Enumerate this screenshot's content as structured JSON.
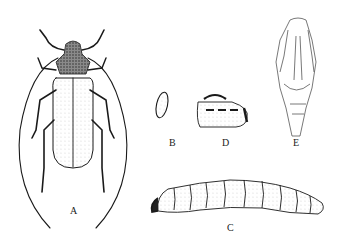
{
  "figure": {
    "panels": [
      {
        "id": "A",
        "label": "A",
        "subject": "adult beetle (dorsal view)"
      },
      {
        "id": "B",
        "label": "B",
        "subject": "egg"
      },
      {
        "id": "C",
        "label": "C",
        "subject": "larva"
      },
      {
        "id": "D",
        "label": "D",
        "subject": "oviposition scar"
      },
      {
        "id": "E",
        "label": "E",
        "subject": "pupa"
      }
    ]
  },
  "colors": {
    "ink": "#1a1a1a",
    "paper": "#ffffff"
  }
}
